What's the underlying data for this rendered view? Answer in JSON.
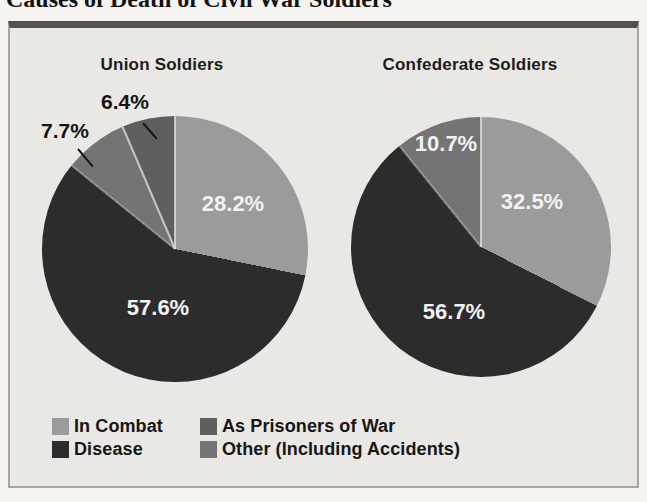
{
  "page": {
    "title": "Causes of Death of Civil War Soldiers"
  },
  "colors": {
    "in_combat": "#9b9b9b",
    "disease": "#2d2c2c",
    "pow": "#5f5f5f",
    "other": "#757474",
    "box_background": "#e9e8e4",
    "box_border": "#a8a5a0",
    "box_top_rule": "#55524e",
    "page_background": "#f6f4f0",
    "label_light": "#f2f2f2",
    "label_dark": "#141414"
  },
  "chart_data": [
    {
      "type": "pie",
      "title": "Union Soldiers",
      "start_angle": "12 o'clock",
      "direction": "clockwise",
      "slices": [
        {
          "label": "In Combat",
          "value": 28.2,
          "display": "28.2%",
          "color_key": "in_combat",
          "label_position": "inside"
        },
        {
          "label": "Disease",
          "value": 57.6,
          "display": "57.6%",
          "color_key": "disease",
          "label_position": "inside"
        },
        {
          "label": "Other (Including Accidents)",
          "value": 7.7,
          "display": "7.7%",
          "color_key": "other",
          "label_position": "outside-callout"
        },
        {
          "label": "As Prisoners of War",
          "value": 6.4,
          "display": "6.4%",
          "color_key": "pow",
          "label_position": "outside-callout"
        }
      ]
    },
    {
      "type": "pie",
      "title": "Confederate Soldiers",
      "start_angle": "12 o'clock",
      "direction": "clockwise",
      "slices": [
        {
          "label": "In Combat",
          "value": 32.5,
          "display": "32.5%",
          "color_key": "in_combat",
          "label_position": "inside"
        },
        {
          "label": "Disease",
          "value": 56.7,
          "display": "56.7%",
          "color_key": "disease",
          "label_position": "inside"
        },
        {
          "label": "Other (Including Accidents)",
          "value": 10.7,
          "display": "10.7%",
          "color_key": "other",
          "label_position": "inside"
        }
      ]
    }
  ],
  "legend": {
    "items": [
      {
        "label": "In Combat",
        "color_key": "in_combat"
      },
      {
        "label": "Disease",
        "color_key": "disease"
      },
      {
        "label": "As Prisoners of War",
        "color_key": "pow"
      },
      {
        "label": "Other (Including Accidents)",
        "color_key": "other"
      }
    ]
  }
}
